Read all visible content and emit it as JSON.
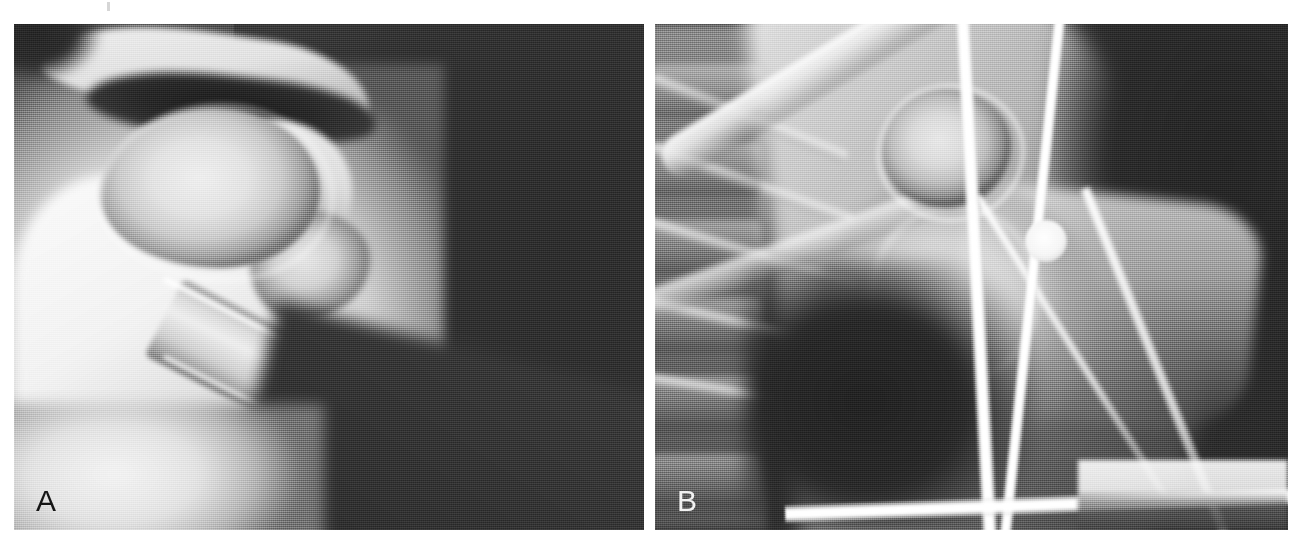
{
  "figure": {
    "kind": "radiograph-figure",
    "panel_count": 2,
    "background_color": "#ffffff",
    "width_px": 1305,
    "height_px": 546
  },
  "panels": [
    {
      "id": "panel-a",
      "label": "A",
      "label_color": "#161616",
      "label_position": "bottom-left",
      "modality": "radiograph",
      "region": "shoulder",
      "view": "axillary-lateral",
      "description": "Grayscale shoulder radiograph showing humeral head, glenoid, acromion and proximal humeral shaft projecting to the lower right against a dark background.",
      "bounds": {
        "x": 14,
        "y": 24,
        "width": 630,
        "height": 506
      },
      "tones": {
        "bone_bright": "#f2f2f2",
        "soft_tissue_mid": "#a8a8a8",
        "background_dark": "#343434"
      }
    },
    {
      "id": "panel-b",
      "label": "B",
      "label_color": "#f2f2f2",
      "label_position": "bottom-left",
      "modality": "radiograph",
      "region": "shoulder",
      "view": "axillary-lateral-with-hardware",
      "description": "Grayscale shoulder radiograph showing ribs and thoracic spine at left, clavicle crossing obliquely, glenohumeral joint centrally, and bright metallic rods plus a round radiopaque marker overlying the field.",
      "bounds": {
        "x": 655,
        "y": 24,
        "width": 633,
        "height": 506
      },
      "tones": {
        "metal_bright": "#ffffff",
        "bone_bright": "#e8e8e8",
        "soft_tissue_mid": "#8e8e8e",
        "background_dark": "#2c2c2c"
      },
      "features": [
        "vertical-rod-left",
        "vertical-rod-right",
        "horizontal-bar-bottom",
        "round-radiopaque-marker",
        "rib-cage-left",
        "clavicle",
        "humeral-head",
        "humeral-shaft"
      ]
    }
  ],
  "artifacts": {
    "top_scan_mark": "faint scan artifact near top edge"
  }
}
